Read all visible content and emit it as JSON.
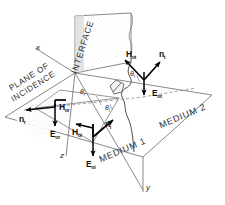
{
  "figure": {
    "background_color": "#ffffff",
    "line_color": "#555555",
    "vector_color": "#000000",
    "text_color": "#222222"
  },
  "axes": [
    {
      "name": "x-axis",
      "label": "x"
    },
    {
      "name": "y-axis",
      "label": "y"
    },
    {
      "name": "z-axis",
      "label": "z"
    }
  ],
  "plane_labels": {
    "interface": "INTERFACE",
    "plane_of_incidence_line1": "PLANE OF",
    "plane_of_incidence_line2": "INCIDENCE",
    "medium_1": "MEDIUM 1",
    "medium_2": "MEDIUM 2"
  },
  "angles": [
    {
      "name": "angle-of-reflection",
      "symbol": "θ",
      "subscript": "r"
    },
    {
      "name": "angle-of-incidence",
      "symbol": "θ",
      "subscript": "i"
    },
    {
      "name": "angle-of-transmission",
      "symbol": "θ",
      "subscript": "t"
    }
  ],
  "vectors": {
    "reflected": [
      {
        "name": "reflected-propagation-vector",
        "symbol": "n",
        "subscript": "r"
      },
      {
        "name": "reflected-magnetic-field-vector",
        "symbol": "H",
        "subscript": "or"
      },
      {
        "name": "reflected-electric-field-vector",
        "symbol": "E",
        "subscript": "or"
      }
    ],
    "incident": [
      {
        "name": "incident-propagation-vector",
        "symbol": "n",
        "subscript": "i"
      },
      {
        "name": "incident-magnetic-field-vector",
        "symbol": "H",
        "subscript": "oi"
      },
      {
        "name": "incident-electric-field-vector",
        "symbol": "E",
        "subscript": "oi"
      }
    ],
    "transmitted": [
      {
        "name": "transmitted-propagation-vector",
        "symbol": "n",
        "subscript": "t"
      },
      {
        "name": "transmitted-magnetic-field-vector",
        "symbol": "H",
        "subscript": "ot"
      },
      {
        "name": "transmitted-electric-field-vector",
        "symbol": "E",
        "subscript": "ot"
      }
    ]
  }
}
